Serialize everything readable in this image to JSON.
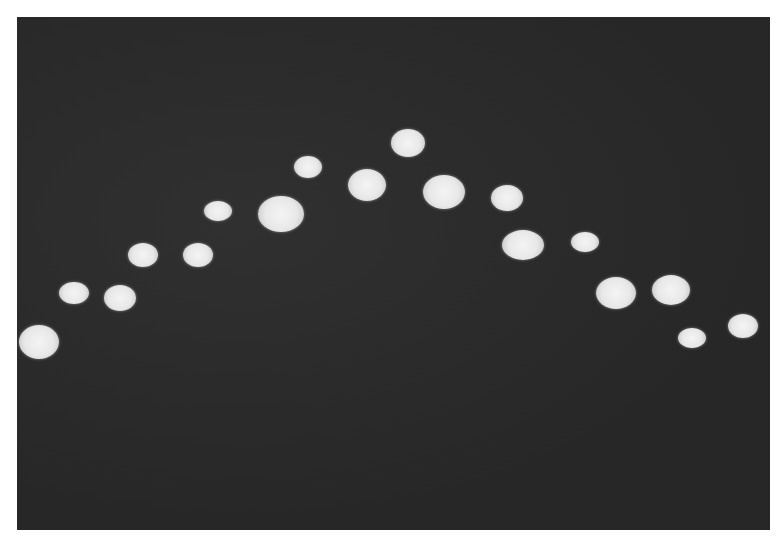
{
  "image": {
    "description": "Grayscale photograph of bright light spots arranged in an arch on a dark background",
    "background_color": "#2b2b2b",
    "spot_color": "#eeeeee",
    "spots": [
      {
        "x": 39,
        "y": 342,
        "w": 40,
        "h": 34
      },
      {
        "x": 74,
        "y": 293,
        "w": 30,
        "h": 22
      },
      {
        "x": 120,
        "y": 298,
        "w": 32,
        "h": 26
      },
      {
        "x": 143,
        "y": 255,
        "w": 30,
        "h": 24
      },
      {
        "x": 198,
        "y": 255,
        "w": 30,
        "h": 24
      },
      {
        "x": 218,
        "y": 211,
        "w": 28,
        "h": 20
      },
      {
        "x": 281,
        "y": 214,
        "w": 46,
        "h": 36
      },
      {
        "x": 308,
        "y": 167,
        "w": 28,
        "h": 22
      },
      {
        "x": 367,
        "y": 185,
        "w": 38,
        "h": 32
      },
      {
        "x": 408,
        "y": 143,
        "w": 34,
        "h": 28
      },
      {
        "x": 444,
        "y": 192,
        "w": 42,
        "h": 34
      },
      {
        "x": 507,
        "y": 198,
        "w": 32,
        "h": 26
      },
      {
        "x": 523,
        "y": 245,
        "w": 42,
        "h": 30
      },
      {
        "x": 585,
        "y": 242,
        "w": 28,
        "h": 20
      },
      {
        "x": 616,
        "y": 293,
        "w": 40,
        "h": 32
      },
      {
        "x": 671,
        "y": 290,
        "w": 38,
        "h": 30
      },
      {
        "x": 692,
        "y": 338,
        "w": 28,
        "h": 20
      },
      {
        "x": 743,
        "y": 326,
        "w": 30,
        "h": 24
      }
    ]
  }
}
